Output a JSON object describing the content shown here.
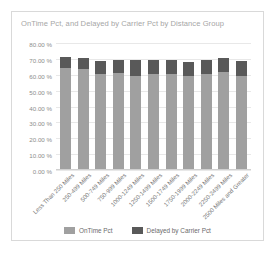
{
  "card": {
    "title": "OnTime Pct, and Delayed by Carrier Pct by Distance Group"
  },
  "axis": {
    "y_ticks": [
      "80.00 %",
      "70.00 %",
      "60.00 %",
      "50.00 %",
      "40.00 %",
      "30.00 %",
      "20.00 %",
      "10.00 %",
      "0.00 %"
    ]
  },
  "legend": [
    {
      "label": "OnTime Pct",
      "color": "#a0a0a0",
      "icon": "legend-swatch"
    },
    {
      "label": "Delayed by Carrier Pct",
      "color": "#595959",
      "icon": "legend-swatch"
    }
  ],
  "chart_data": {
    "type": "bar",
    "stacked": true,
    "title": "OnTime Pct, and Delayed by Carrier Pct by Distance Group",
    "xlabel": "",
    "ylabel": "",
    "ylim": [
      0,
      80
    ],
    "ytick_step": 10,
    "ytick_format": "0.00 %",
    "grid": true,
    "legend_position": "bottom",
    "categories": [
      "Less Than 250 Miles",
      "250-499 Miles",
      "500-749 Miles",
      "750-999 Miles",
      "1000-1249 Miles",
      "1250-1499 Miles",
      "1500-1749 Miles",
      "1750-1999 Miles",
      "2000-2249 Miles",
      "2250-2499 Miles",
      "2500 Miles and Greater"
    ],
    "series": [
      {
        "name": "OnTime Pct",
        "color": "#a0a0a0",
        "values": [
          64.0,
          63.5,
          60.5,
          61.0,
          59.5,
          60.5,
          60.5,
          59.5,
          60.5,
          62.0,
          59.5
        ]
      },
      {
        "name": "Delayed by Carrier Pct",
        "color": "#595959",
        "values": [
          7.0,
          7.0,
          8.0,
          8.0,
          9.5,
          8.5,
          8.5,
          8.5,
          8.5,
          8.5,
          9.0
        ]
      }
    ],
    "totals": [
      71.0,
      70.5,
      68.5,
      69.0,
      69.0,
      69.0,
      69.0,
      68.0,
      69.0,
      70.5,
      68.5
    ]
  }
}
